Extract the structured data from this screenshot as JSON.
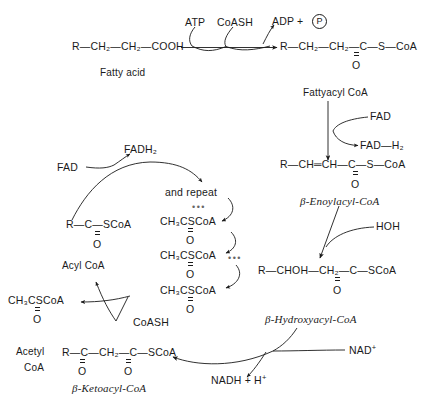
{
  "diagram": {
    "stroke_color": "#1a1a1a",
    "background": "#ffffff"
  },
  "top_row": {
    "fatty_acid_formula": "R—CH₂—CH₂—COOH",
    "fatty_acid_name": "Fatty acid",
    "cofactor_in_1": "ATP",
    "cofactor_in_2": "CoASH",
    "product_out": "ADP  +",
    "phosphate_symbol": "P",
    "acyl_formula_part1": "R—CH₂—CH₂—C—S—CoA",
    "acyl_carbonyl_o": "O"
  },
  "right_column": {
    "fattyacyl_coa_name": "Fattyacyl CoA",
    "fad_in": "FAD",
    "fadh2_out": "FAD—H₂",
    "enoyl_formula": "R—CH═CH—C—S—CoA",
    "enoyl_carbonyl_o": "O",
    "enoyl_name": "β-Enoylacyl-CoA",
    "hoh_in": "HOH",
    "hydroxy_formula": "R—CHOH—CH₂—C—SCoA",
    "hydroxy_carbonyl_o": "O",
    "hydroxy_name": "β-Hydroxyacyl-CoA",
    "nad_in": "NAD",
    "nad_charge": "+",
    "nadh_out": "NADH  +  H",
    "nadh_charge": "+"
  },
  "bottom_row": {
    "ketoacyl_formula": "R—C—CH₂—C—SCoA",
    "ketoacyl_o_left": "O",
    "ketoacyl_o_right": "O",
    "ketoacyl_name": "β-Ketoacyl-CoA",
    "coash_in": "CoASH",
    "acetyl_formula": "CH₃CSCoA",
    "acetyl_carbonyl_o": "O",
    "acetyl_name_line1": "Acetyl",
    "acetyl_name_line2": "CoA"
  },
  "left_cycle": {
    "acyl_formula": "R—C—SCoA",
    "acyl_carbonyl_o": "O",
    "acyl_name": "Acyl CoA",
    "fad_in": "FAD",
    "fadh2_out": "FADH₂"
  },
  "repeat_block": {
    "repeat_label": "and repeat",
    "ellipsis_top": "•••",
    "unit_1_formula": "CH₃CSCoA",
    "unit_1_o": "O",
    "unit_2_formula": "CH₃CSCoA",
    "unit_2_ellipsis": "•••",
    "unit_2_o": "O",
    "unit_3_formula": "CH₃CSCoA",
    "unit_3_o": "O"
  }
}
